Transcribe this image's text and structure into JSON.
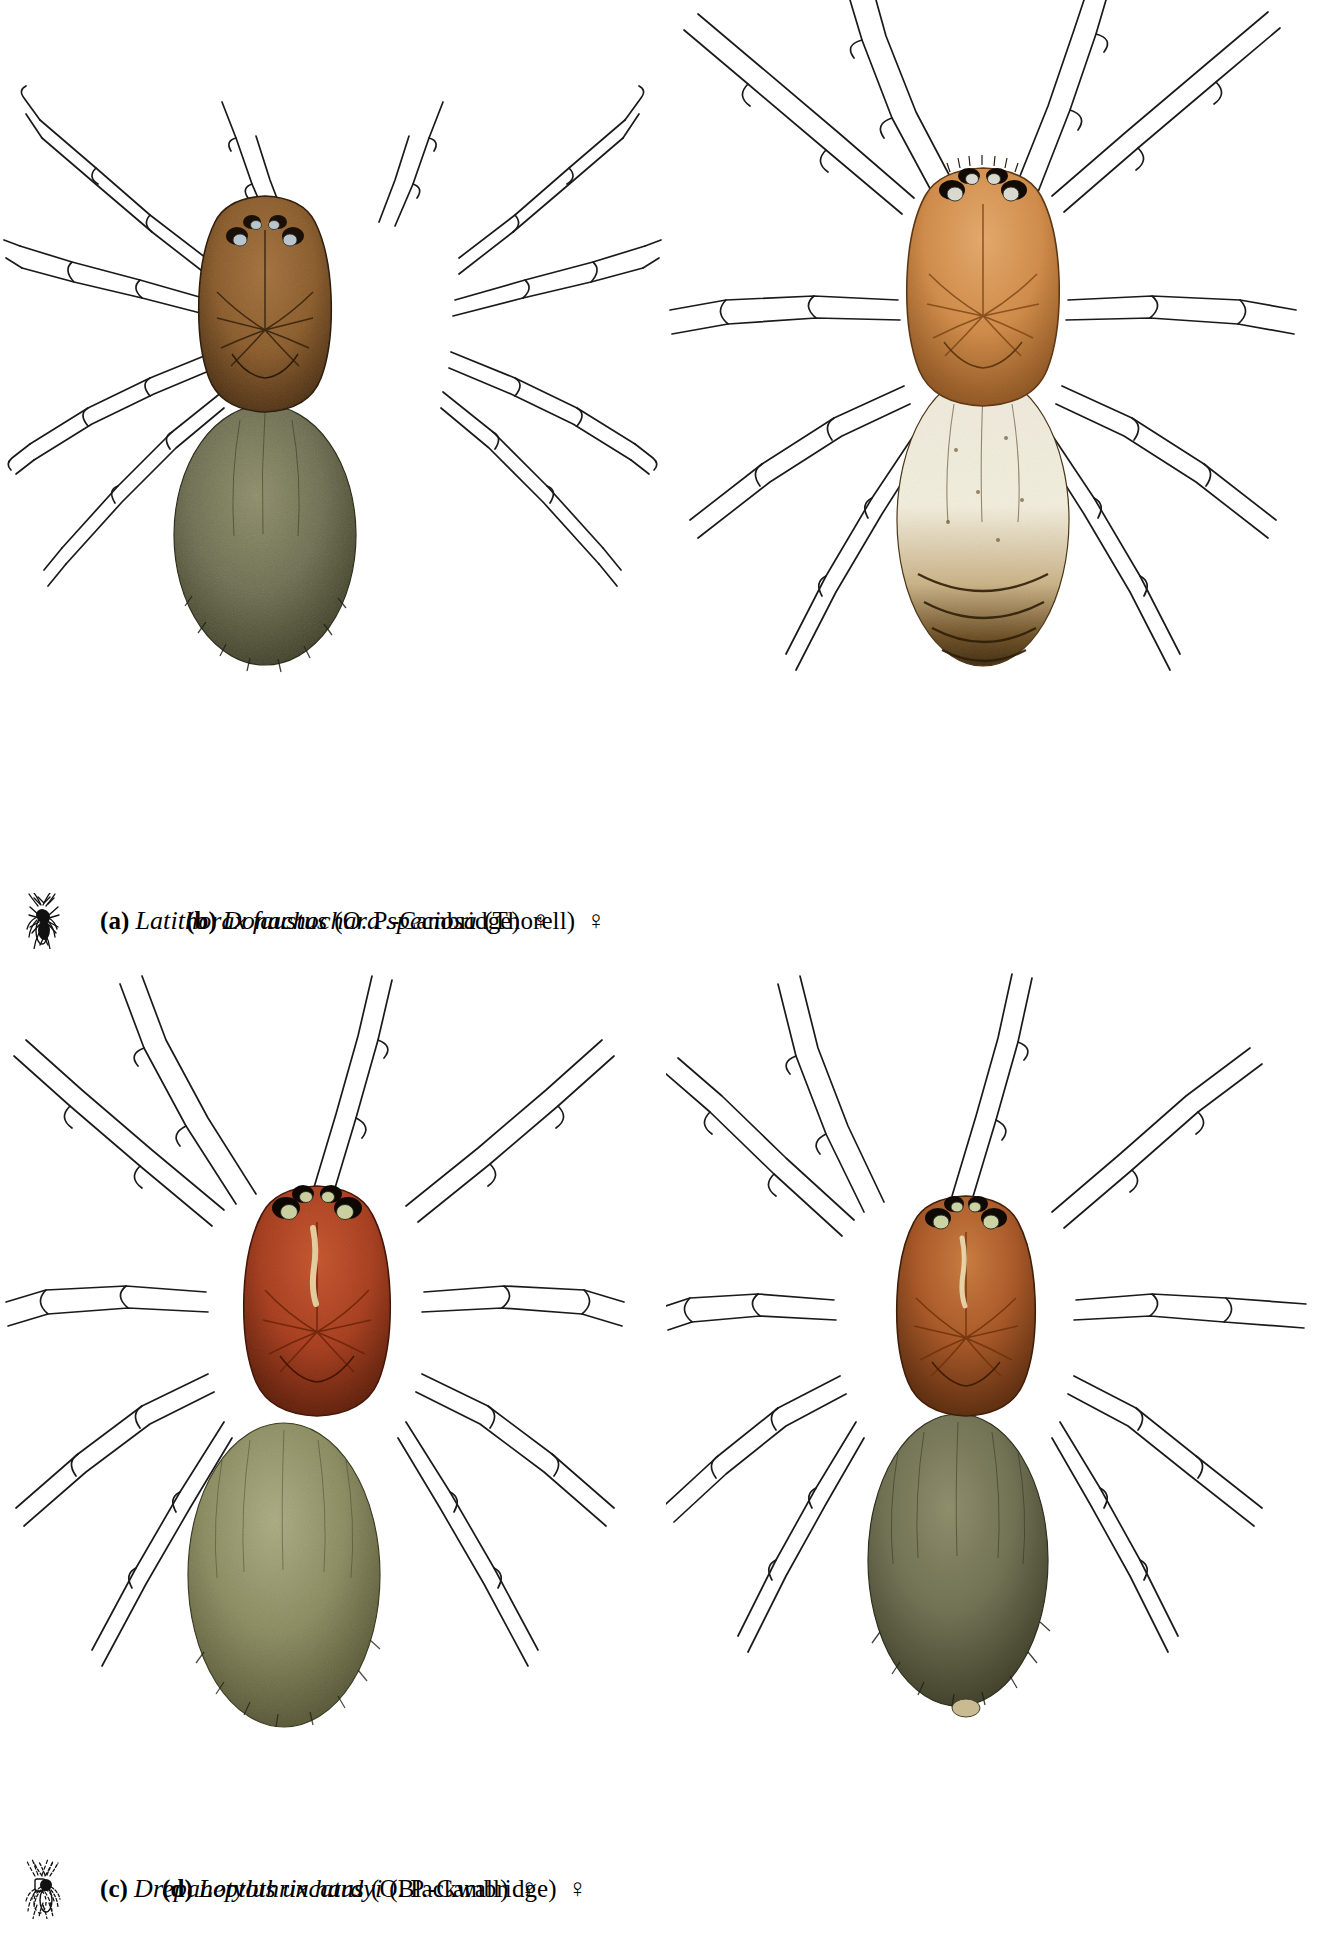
{
  "plate": {
    "kind": "scientific-illustration-plate",
    "background": "#ffffff",
    "panel_count": 4,
    "layout": "2x2"
  },
  "panels": [
    {
      "key": "a",
      "letter": "a",
      "label_letter": "(a)",
      "species": "Latithorax faustus",
      "authority": "(O. P.-Cambridge)",
      "sex_symbol": "♀",
      "sex_name": "female",
      "caption_full": "(a) Latithorax faustus (O. P.-Cambridge) ♀",
      "silhouette_style": "solid",
      "colors": {
        "carapace": "#8a5a28",
        "carapace_dark": "#4a2d10",
        "carapace_light": "#b5813f",
        "abdomen": "#6d6e4f",
        "abdomen_dark": "#36361f",
        "abdomen_light": "#8d8d68",
        "eye": "#b9c6cc",
        "legs_outline": "#1a1a1a"
      }
    },
    {
      "key": "b",
      "letter": "b",
      "label_letter": "(b)",
      "species": "Donachochara speciosa",
      "authority": "(Thorell)",
      "sex_symbol": "♀",
      "sex_name": "female",
      "caption_full": "(b) Donachochara speciosa (Thorell) ♀",
      "silhouette_style": "solid",
      "colors": {
        "carapace": "#d08a46",
        "carapace_dark": "#8f5520",
        "carapace_light": "#e3a869",
        "abdomen": "#eae3c8",
        "abdomen_dark": "#4a3415",
        "abdomen_light": "#f6f2e2",
        "eye": "#d9d9cf",
        "legs_outline": "#1a1a1a"
      }
    },
    {
      "key": "c",
      "letter": "c",
      "label_letter": "(c)",
      "species": "Drepanotylus uncatus",
      "authority": "(O. P.-Cambridge)",
      "sex_symbol": "♀",
      "sex_name": "female",
      "caption_full": "(c) Drepanotylus uncatus (O. P.-Cambridge) ♀",
      "silhouette_style": "outline",
      "colors": {
        "carapace": "#a63c1c",
        "carapace_dark": "#5d1d08",
        "carapace_light": "#c4542c",
        "abdomen": "#8a8a5e",
        "abdomen_dark": "#4c4c2c",
        "abdomen_light": "#aaaa80",
        "eye": "#c9cf9e",
        "legs_outline": "#1a1a1a"
      }
    },
    {
      "key": "d",
      "letter": "d",
      "label_letter": "(d)",
      "species": "Leptothrix hardyi",
      "authority": "(Blackwall)",
      "sex_symbol": "♀",
      "sex_name": "female",
      "caption_full": "(d) Leptothrix hardyi (Blackwall) ♀",
      "silhouette_style": "dashed",
      "colors": {
        "carapace": "#a85523",
        "carapace_dark": "#5c2a0a",
        "carapace_light": "#c97a3c",
        "abdomen": "#6b6b4c",
        "abdomen_dark": "#33331d",
        "abdomen_light": "#8b8b66",
        "eye": "#cbd2a4",
        "legs_outline": "#1a1a1a"
      }
    }
  ],
  "icons": {
    "mini_spider": "mini-spider-icon",
    "female_symbol": "female-symbol-icon"
  }
}
